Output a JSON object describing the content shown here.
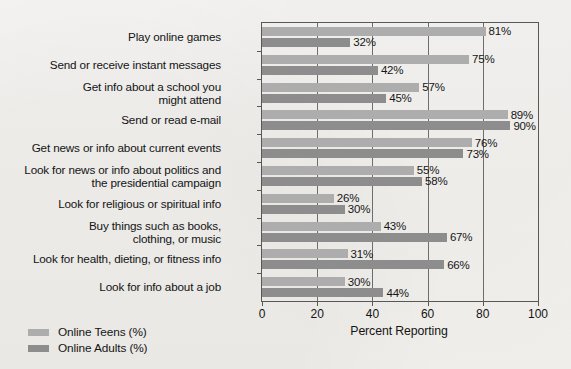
{
  "chart_data": {
    "type": "bar",
    "orientation": "horizontal",
    "title": "",
    "xlabel": "Percent Reporting",
    "ylabel": "",
    "xlim": [
      0,
      100
    ],
    "xticks": [
      0,
      20,
      40,
      60,
      80,
      100
    ],
    "grid": true,
    "grid_axis": "x",
    "legend_position": "bottom-left",
    "categories": [
      "Play online games",
      "Send or receive instant messages",
      "Get info about a school you might attend",
      "Send or read e-mail",
      "Get news or info about current events",
      "Look for news or info about politics and the presidential campaign",
      "Look for religious or spiritual info",
      "Buy things such as books, clothing, or music",
      "Look for health, dieting, or fitness info",
      "Look for info about a job"
    ],
    "category_lines": [
      [
        "Play online games"
      ],
      [
        "Send or receive instant messages"
      ],
      [
        "Get info about a school you",
        "might attend"
      ],
      [
        "Send or read e-mail"
      ],
      [
        "Get news or info about current events"
      ],
      [
        "Look for news or info about politics and",
        "the presidential campaign"
      ],
      [
        "Look for religious or spiritual info"
      ],
      [
        "Buy things such as books,",
        "clothing, or music"
      ],
      [
        "Look for health, dieting, or fitness info"
      ],
      [
        "Look for info about a job"
      ]
    ],
    "series": [
      {
        "name": "Online Teens (%)",
        "color": "#adadad",
        "values": [
          81,
          75,
          57,
          89,
          76,
          55,
          26,
          43,
          31,
          30
        ],
        "labels": [
          "81%",
          "75%",
          "57%",
          "89%",
          "76%",
          "55%",
          "26%",
          "43%",
          "31%",
          "30%"
        ]
      },
      {
        "name": "Online Adults (%)",
        "color": "#8d8d8d",
        "values": [
          32,
          42,
          45,
          90,
          73,
          58,
          30,
          67,
          66,
          44
        ],
        "labels": [
          "32%",
          "42%",
          "45%",
          "90%",
          "73%",
          "58%",
          "30%",
          "67%",
          "66%",
          "44%"
        ]
      }
    ]
  },
  "legend": {
    "items": [
      {
        "label": "Online Teens (%)",
        "color": "#adadad"
      },
      {
        "label": "Online Adults (%)",
        "color": "#8d8d8d"
      }
    ]
  },
  "axis": {
    "x_title": "Percent Reporting",
    "x_tick_labels": [
      "0",
      "20",
      "40",
      "60",
      "80",
      "100"
    ]
  }
}
